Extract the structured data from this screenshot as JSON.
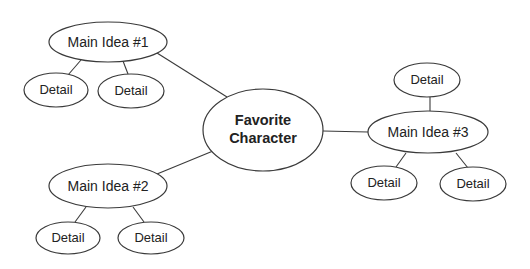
{
  "diagram": {
    "type": "web-organizer",
    "center": {
      "line1": "Favorite",
      "line2": "Character"
    },
    "main_ideas": [
      {
        "label": "Main Idea #1",
        "details": [
          "Detail",
          "Detail"
        ]
      },
      {
        "label": "Main Idea #2",
        "details": [
          "Detail",
          "Detail"
        ]
      },
      {
        "label": "Main Idea #3",
        "details": [
          "Detail",
          "Detail",
          "Detail"
        ]
      }
    ],
    "colors": {
      "stroke": "#3a3a3a",
      "fill": "#ffffff",
      "text": "#222222"
    }
  }
}
